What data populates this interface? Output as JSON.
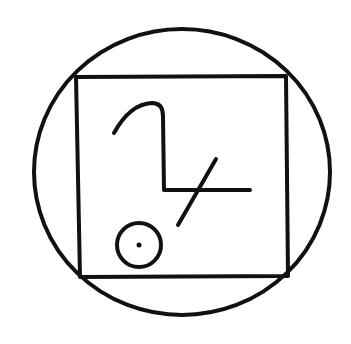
{
  "diagram": {
    "type": "sigil",
    "colors": {
      "background": "#ffffff",
      "ink": "#111111"
    },
    "stroke_width": 4,
    "outer_circle": {
      "cx": 182,
      "cy": 172,
      "rx": 148,
      "ry": 143
    },
    "square": {
      "points": [
        [
          76,
          77
        ],
        [
          286,
          76
        ],
        [
          288,
          276
        ],
        [
          80,
          277
        ]
      ]
    },
    "hook_path": "M114,133 Q130,104 152,103 Q163,103 163,116 L164,190 L250,190",
    "diagonal": {
      "x1": 216,
      "y1": 159,
      "x2": 178,
      "y2": 225
    },
    "small_circle": {
      "cx": 139,
      "cy": 245,
      "r": 22
    },
    "center_dot": {
      "cx": 139,
      "cy": 245,
      "r": 2.5
    }
  }
}
